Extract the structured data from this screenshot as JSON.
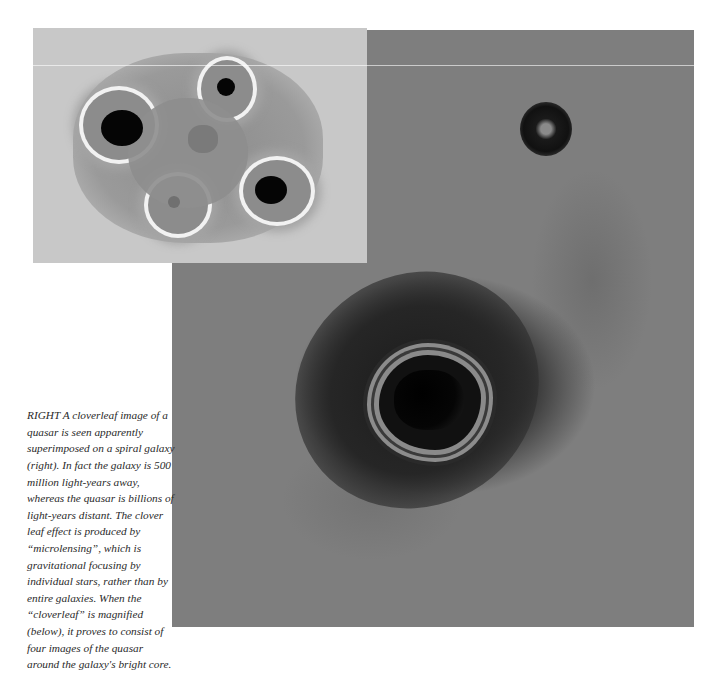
{
  "images": {
    "main": {
      "description": "Spiral galaxy with cloverleaf quasar image near core and a foreground star",
      "colors": {
        "background": "#7e7e7e",
        "galaxy_core": "#1c1c1c",
        "ring": "#8a8a8a"
      }
    },
    "inset": {
      "description": "Magnified cloverleaf showing four quasar images around the galaxy's bright core",
      "colors": {
        "background": "#c8c8c8",
        "halo": "#8c8c8c",
        "highlight": "#f2f2f2",
        "core": "#050505"
      }
    }
  },
  "caption": {
    "lead": "RIGHT",
    "text": " A cloverleaf image of a quasar is seen apparently superimposed on a spiral galaxy (right). In fact the galaxy is 500 million light-years away, whereas the quasar is billions of light-years distant. The clover leaf effect is produced by “microlensing”, which is gravitational focusing by individual stars, rather than by entire galaxies. When the “cloverleaf” is magnified (below), it proves to consist of four images of the quasar around the galaxy's bright core."
  }
}
